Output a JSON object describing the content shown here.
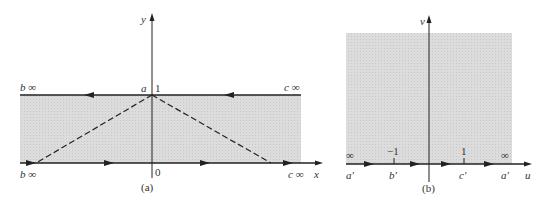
{
  "figure_a": {
    "caption": "(a)",
    "axis_x_label": "x",
    "axis_y_label": "y",
    "origin_label": "0",
    "point_a_label": "a",
    "one_label": "1",
    "top_left_label": "b ∞",
    "top_right_label": "c ∞",
    "bottom_left_label": "b ∞",
    "bottom_right_label": "c ∞",
    "shade_color": "#d9d9d9",
    "line_color": "#222222"
  },
  "figure_b": {
    "caption": "(b)",
    "axis_u_label": "u",
    "axis_v_label": "v",
    "tick_minus_one": "−1",
    "tick_one": "1",
    "inf_left": "∞",
    "inf_right": "∞",
    "a_prime_left": "a′",
    "b_prime": "b′",
    "c_prime": "c′",
    "a_prime_right": "a′",
    "shade_color": "#d9d9d9"
  }
}
